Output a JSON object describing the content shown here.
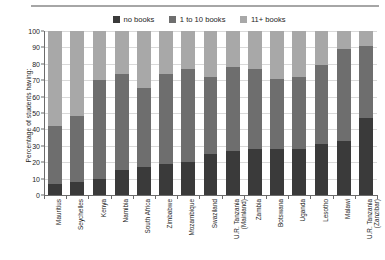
{
  "chart_data": {
    "type": "bar",
    "subtype": "stacked-100-percent",
    "title": "",
    "xlabel": "",
    "ylabel": "Percentage of students having:",
    "ylim": [
      0,
      100
    ],
    "yticks": [
      0,
      10,
      20,
      30,
      40,
      50,
      60,
      70,
      80,
      90,
      100
    ],
    "grid": true,
    "legend_position": "top",
    "categories": [
      "Mauritius",
      "Seychelles",
      "Kenya",
      "Namibia",
      "South Africa",
      "Zimbabwe",
      "Mozambique",
      "Swaziland",
      "U.R. Tanzania (Mainland)",
      "Zambia",
      "Botswana",
      "Uganda",
      "Lesotho",
      "Malawi",
      "U.R. Tanzania (Zanzibar)"
    ],
    "categories_wrapped": [
      [
        "Mauritius",
        ""
      ],
      [
        "Seychelles",
        ""
      ],
      [
        "Kenya",
        ""
      ],
      [
        "Namibia",
        ""
      ],
      [
        "South Africa",
        ""
      ],
      [
        "Zimbabwe",
        ""
      ],
      [
        "Mozambique",
        ""
      ],
      [
        "Swaziland",
        ""
      ],
      [
        "U.R. Tanzania",
        "(Mainland)"
      ],
      [
        "Zambia",
        ""
      ],
      [
        "Botswana",
        ""
      ],
      [
        "Uganda",
        ""
      ],
      [
        "Lesotho",
        ""
      ],
      [
        "Malawi",
        ""
      ],
      [
        "U.R. Tanzania",
        "(Zanzibar)"
      ]
    ],
    "series": [
      {
        "name": "no books",
        "color": "#3a3a3a",
        "values": [
          7,
          8,
          10,
          15,
          17,
          19,
          20,
          25,
          27,
          28,
          28,
          28,
          31,
          33,
          47
        ]
      },
      {
        "name": "1 to 10 books",
        "color": "#6e6e6e",
        "values": [
          35,
          40,
          60,
          59,
          48,
          55,
          57,
          47,
          51,
          49,
          43,
          44,
          48,
          56,
          44
        ]
      },
      {
        "name": "11+ books",
        "color": "#a8a8a8",
        "values": [
          58,
          52,
          30,
          26,
          35,
          26,
          23,
          28,
          22,
          23,
          29,
          28,
          21,
          11,
          9
        ]
      }
    ],
    "cumulative_tops": {
      "no_books": [
        7,
        8,
        10,
        15,
        17,
        19,
        20,
        25,
        27,
        28,
        28,
        28,
        31,
        33,
        47
      ],
      "through_1_to_10": [
        42,
        48,
        70,
        74,
        65,
        74,
        77,
        72,
        78,
        77,
        71,
        72,
        79,
        89,
        91
      ]
    }
  },
  "legend": {
    "items": [
      {
        "label": "no books",
        "color": "#3a3a3a"
      },
      {
        "label": "1 to 10 books",
        "color": "#6e6e6e"
      },
      {
        "label": "11+ books",
        "color": "#a8a8a8"
      }
    ]
  }
}
